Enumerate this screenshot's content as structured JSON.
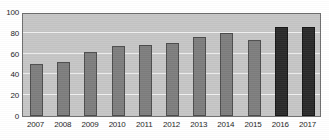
{
  "chart_data": {
    "type": "bar",
    "title": "",
    "subtitle": "",
    "xlabel": "",
    "ylabel": "",
    "categories": [
      "2007",
      "2008",
      "2009",
      "2010",
      "2011",
      "2012",
      "2013",
      "2014",
      "2015",
      "2016",
      "2017"
    ],
    "values": [
      50,
      52,
      62,
      67,
      68,
      70,
      76,
      80,
      73,
      86,
      86
    ],
    "series": [
      {
        "name": "",
        "values": [
          50,
          52,
          62,
          67,
          68,
          70,
          76,
          80,
          73,
          86,
          86
        ]
      }
    ],
    "bar_styles": [
      "light",
      "light",
      "light",
      "light",
      "light",
      "light",
      "light",
      "light",
      "light",
      "dark",
      "dark"
    ],
    "ylim": [
      0,
      100
    ],
    "yticks": [
      0,
      20,
      40,
      60,
      80,
      100
    ],
    "ytick_labels": [
      "0",
      "20",
      "40",
      "60",
      "80",
      "100"
    ],
    "xtick_labels": [
      "2007",
      "2008",
      "2009",
      "2010",
      "2011",
      "2012",
      "2013",
      "2014",
      "2015",
      "2016",
      "2017"
    ],
    "grid": true,
    "grid_axis": "y",
    "legend": null,
    "legend_position": "none",
    "annotations": [],
    "colors": {
      "bar_light": "#7e7e7e",
      "bar_dark": "#2b2b2b",
      "plot_background": "#c6c6c6",
      "figure_background": "#ffffff",
      "gridline": "#efefef",
      "axis_border": "#6e6e6e",
      "tick_label": "#1c1c1c"
    }
  }
}
